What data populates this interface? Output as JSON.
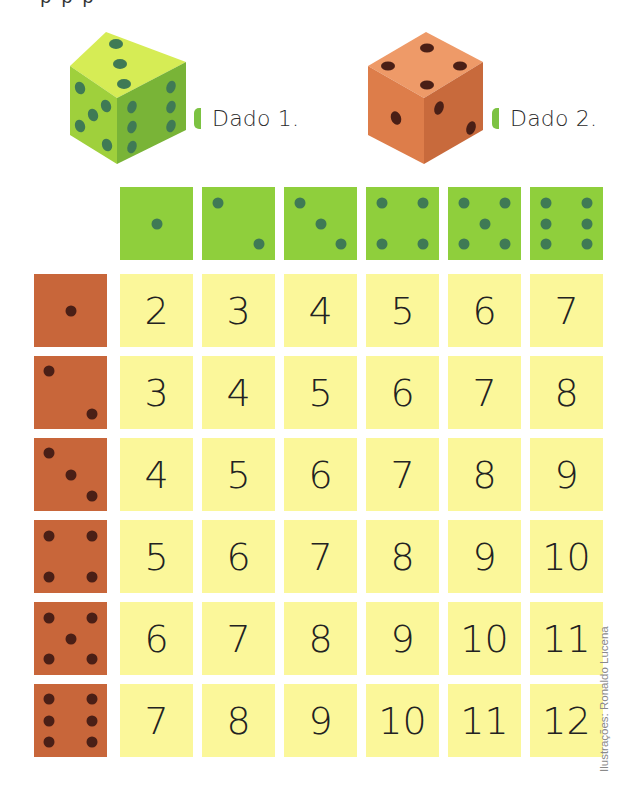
{
  "top_text_cut": "p    p    p",
  "dice": [
    {
      "label": "Dado 1.",
      "color_top": "#d6ec55",
      "color_left": "#9fd03c",
      "color_right": "#79b437",
      "pip": "#3f7a55"
    },
    {
      "label": "Dado 2.",
      "color_top": "#ee9a68",
      "color_left": "#dd7d4a",
      "color_right": "#c86a3c",
      "pip": "#4a1f16"
    }
  ],
  "label_marker_color": "#7cc242",
  "table": {
    "header_faces": [
      1,
      2,
      3,
      4,
      5,
      6
    ],
    "row_faces": [
      1,
      2,
      3,
      4,
      5,
      6
    ],
    "rows": [
      [
        "2",
        "3",
        "4",
        "5",
        "6",
        "7"
      ],
      [
        "3",
        "4",
        "5",
        "6",
        "7",
        "8"
      ],
      [
        "4",
        "5",
        "6",
        "7",
        "8",
        "9"
      ],
      [
        "5",
        "6",
        "7",
        "8",
        "9",
        "10"
      ],
      [
        "6",
        "7",
        "8",
        "9",
        "10",
        "11"
      ],
      [
        "7",
        "8",
        "9",
        "10",
        "11",
        "12"
      ]
    ],
    "colors": {
      "header": "#8fcf3c",
      "row_header": "#c8663a",
      "cell": "#fbf79a"
    }
  },
  "credit": "Ilustrações: Ronaldo Lucena"
}
